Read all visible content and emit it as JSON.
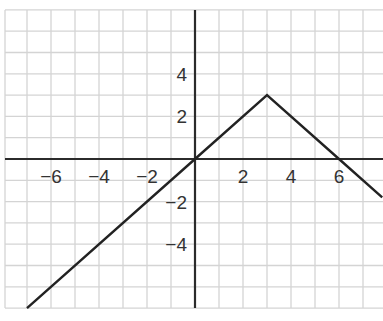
{
  "chart_data": {
    "type": "line",
    "title": "",
    "xlabel": "",
    "ylabel": "",
    "xlim": [
      -7.9,
      7.8
    ],
    "ylim": [
      -7,
      7
    ],
    "grid": true,
    "grid_step": 1,
    "x_ticks": [
      -6,
      -4,
      -2,
      2,
      4,
      6
    ],
    "x_tick_labels": [
      "−6",
      "−4",
      "−2",
      "2",
      "4",
      "6"
    ],
    "y_ticks": [
      4,
      2,
      -2,
      -4
    ],
    "y_tick_labels": [
      "4",
      "2",
      "−2",
      "−4"
    ],
    "series": [
      {
        "name": "piecewise linear function",
        "points": [
          [
            -7,
            -7
          ],
          [
            0,
            0
          ],
          [
            3,
            3
          ],
          [
            6,
            0
          ],
          [
            7.8,
            -1.8
          ]
        ],
        "description": "y = x for x <= 3; y = -x + 6 for x >= 3"
      }
    ],
    "legend": null
  },
  "colors": {
    "background": "#ffffff",
    "grid": "#d4d4d4",
    "axis": "#2b2b2b",
    "line": "#222222",
    "label": "#333333"
  },
  "layout": {
    "origin_px": [
      195,
      159
    ],
    "x_unit_px": 24,
    "y_unit_px": 21.3,
    "plot_left_px": 5,
    "plot_right_px": 383,
    "plot_top_px": 10,
    "plot_bottom_px": 308
  }
}
